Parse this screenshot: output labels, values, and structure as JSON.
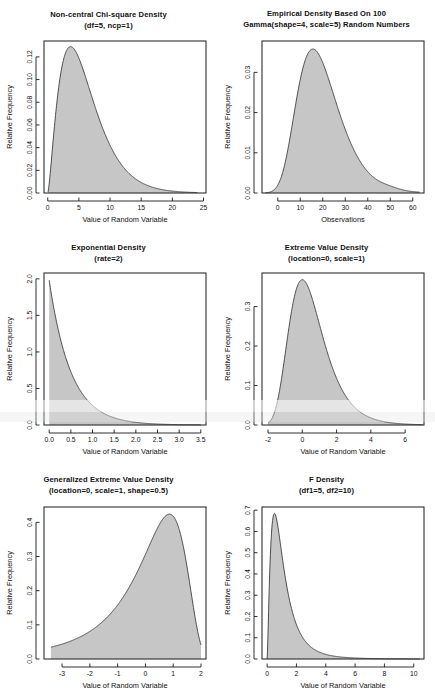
{
  "figure": {
    "background_color": "#ffffff",
    "fill_color": "#c6c6c6",
    "line_color": "#3c3c3c",
    "axis_color": "#1a1a1a",
    "layout": "2 columns x 3 rows",
    "shared_ylabel": "Relative Frequency"
  },
  "chart_data": [
    {
      "type": "area",
      "title": "Non-central Chi-square Density",
      "subtitle": "(df=5, ncp=1)",
      "xlabel": "Value of Random Variable",
      "ylabel": "Relative Frequency",
      "distribution": "noncentral-chisq",
      "params": {
        "df": 5,
        "ncp": 1
      },
      "xlim": [
        -0.6,
        25.4
      ],
      "ylim": [
        0,
        0.134
      ],
      "xticks": [
        0,
        5,
        10,
        15,
        20,
        25
      ],
      "xtick_labels": [
        "0",
        "5",
        "10",
        "15",
        "20",
        "25"
      ],
      "yticks": [
        0.0,
        0.02,
        0.04,
        0.06,
        0.08,
        0.1,
        0.12
      ],
      "ytick_labels": [
        "0.00",
        "0.02",
        "0.04",
        "0.06",
        "0.08",
        "0.10",
        "0.12"
      ],
      "data_xmin": 0.05,
      "data_xmax": 24.0,
      "peak_x": 3.8,
      "peak_y": 0.129,
      "grid": false,
      "legend": null
    },
    {
      "type": "area",
      "title": "Empirical Density Based On 100",
      "subtitle": "Gamma(shape=4, scale=5) Random Numbers",
      "xlabel": "Observations",
      "ylabel": "Relative Frequency",
      "distribution": "empirical-gamma-kde",
      "params": {
        "shape": 4,
        "scale": 5,
        "n": 100
      },
      "xlim": [
        -7,
        65
      ],
      "ylim": [
        0,
        0.0378
      ],
      "xticks": [
        0,
        10,
        20,
        30,
        40,
        50,
        60
      ],
      "xtick_labels": [
        "0",
        "10",
        "20",
        "30",
        "40",
        "50",
        "60"
      ],
      "yticks": [
        0.0,
        0.01,
        0.02,
        0.03
      ],
      "ytick_labels": [
        "0.00",
        "0.01",
        "0.02",
        "0.03"
      ],
      "data_xmin": -5.5,
      "data_xmax": 63.0,
      "peak_x": 16.0,
      "peak_y": 0.0358,
      "shoulder_x": 50.0,
      "shoulder_y": 0.0035,
      "grid": false,
      "legend": null
    },
    {
      "type": "area",
      "title": "Exponential Density",
      "subtitle": "(rate=2)",
      "xlabel": "Value of Random Variable",
      "ylabel": "Relative Frequency",
      "distribution": "exponential",
      "params": {
        "rate": 2
      },
      "xlim": [
        -0.12,
        3.62
      ],
      "ylim": [
        0,
        2.08
      ],
      "xticks": [
        0.0,
        0.5,
        1.0,
        1.5,
        2.0,
        2.5,
        3.0,
        3.5
      ],
      "xtick_labels": [
        "0.0",
        "0.5",
        "1.0",
        "1.5",
        "2.0",
        "2.5",
        "3.0",
        "3.5"
      ],
      "yticks": [
        0.0,
        0.5,
        1.0,
        1.5,
        2.0
      ],
      "ytick_labels": [
        "0.0",
        "0.5",
        "1.0",
        "1.5",
        "2.0"
      ],
      "data_xmin": 0.0,
      "data_xmax": 3.5,
      "peak_x": 0.0,
      "peak_y": 1.98,
      "grid": false,
      "legend": null
    },
    {
      "type": "area",
      "title": "Extreme Value Density",
      "subtitle": "(location=0, scale=1)",
      "xlabel": "Value of Random Variable",
      "ylabel": "Relative Frequency",
      "distribution": "gumbel",
      "params": {
        "location": 0,
        "scale": 1
      },
      "xlim": [
        -2.35,
        7.1
      ],
      "ylim": [
        0,
        0.385
      ],
      "xticks": [
        -2,
        0,
        2,
        4,
        6
      ],
      "xtick_labels": [
        "-2",
        "0",
        "2",
        "4",
        "6"
      ],
      "yticks": [
        0.0,
        0.1,
        0.2,
        0.3
      ],
      "ytick_labels": [
        "0.0",
        "0.1",
        "0.2",
        "0.3"
      ],
      "data_xmin": -2.0,
      "data_xmax": 7.0,
      "peak_x": 0.05,
      "peak_y": 0.368,
      "grid": false,
      "legend": null
    },
    {
      "type": "area",
      "title": "Generalized Extreme Value Density",
      "subtitle": "(location=0, scale=1, shape=0.5)",
      "xlabel": "Value of Random Variable",
      "ylabel": "Relative Frequency",
      "distribution": "gev-negative-skew",
      "params": {
        "location": 0,
        "scale": 1,
        "shape": 0.5
      },
      "xlim": [
        -3.65,
        2.18
      ],
      "ylim": [
        0,
        0.445
      ],
      "xticks": [
        -3,
        -2,
        -1,
        0,
        1,
        2
      ],
      "xtick_labels": [
        "-3",
        "-2",
        "-1",
        "0",
        "1",
        "2"
      ],
      "yticks": [
        0.0,
        0.1,
        0.2,
        0.3,
        0.4
      ],
      "ytick_labels": [
        "0.0",
        "0.1",
        "0.2",
        "0.3",
        "0.4"
      ],
      "data_xmin": -3.4,
      "data_xmax": 2.0,
      "peak_x": 0.62,
      "peak_y": 0.424,
      "grid": false,
      "legend": null
    },
    {
      "type": "area",
      "title": "F Density",
      "subtitle": "(df1=5, df2=10)",
      "xlabel": "Value of Random Variable",
      "ylabel": "Relative Frequency",
      "distribution": "f",
      "params": {
        "df1": 5,
        "df2": 10
      },
      "xlim": [
        -0.35,
        10.7
      ],
      "ylim": [
        0,
        0.715
      ],
      "xticks": [
        0,
        2,
        4,
        6,
        8,
        10
      ],
      "xtick_labels": [
        "0",
        "2",
        "4",
        "6",
        "8",
        "10"
      ],
      "yticks": [
        0.0,
        0.1,
        0.2,
        0.3,
        0.4,
        0.5,
        0.6,
        0.7
      ],
      "ytick_labels": [
        "0.0",
        "0.1",
        "0.2",
        "0.3",
        "0.4",
        "0.5",
        "0.6",
        "0.7"
      ],
      "data_xmin": 0.0,
      "data_xmax": 10.4,
      "peak_x": 0.56,
      "peak_y": 0.685,
      "grid": false,
      "legend": null
    }
  ]
}
